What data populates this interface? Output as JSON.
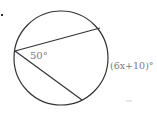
{
  "diagram": {
    "problem_marker": ".",
    "circle": {
      "cx": 61,
      "cy": 58,
      "r": 47,
      "stroke": "#333333"
    },
    "vertex": {
      "x": 15,
      "y": 51
    },
    "chords": [
      {
        "to": {
          "x": 100,
          "y": 28
        }
      },
      {
        "to": {
          "x": 82,
          "y": 100
        }
      }
    ],
    "labels": {
      "inscribed_angle": "50°",
      "arc": "(6x+10)°"
    }
  }
}
